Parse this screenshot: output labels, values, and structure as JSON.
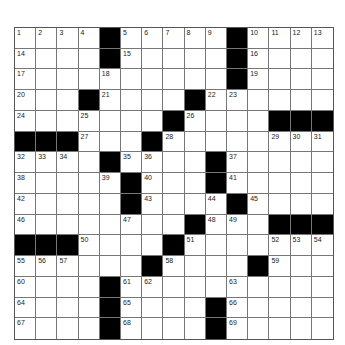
{
  "puzzle": {
    "header_text": "",
    "rows": 15,
    "cols": 15,
    "layout": [
      "1 2 3 4 # 5 6 7 8 9 # 10 11 12 13",
      "14 . . . # 15 . . . . # 16 . . .",
      "17 . . . 18 . . . . . # 19 . . .",
      "20 . . # 21 . . . # 22 23 . . . .",
      "24 . . 25 . . . # 26 . . . # # #",
      "# # # 27 . . # 28 . . . . 29 30 31",
      "32 33 34 . # 35 36 . . # 37 . . . .",
      "38 . . . 39 # 40 . . # 41 . . . .",
      "42 . . . . # 43 . . 44 # 45 . . .",
      "46 . . . . 47 . . # 48 49 . # # #",
      "# # # 50 . . . # 51 . . . 52 53 54",
      "55 56 57 . . . # 58 . . . # 59 . .",
      "60 . . . # 61 62 . . . 63 . . . .",
      "64 . . . # 65 . . . # 66 . . . .",
      "67 . . . # 68 . . . # 69 . . . ."
    ]
  }
}
